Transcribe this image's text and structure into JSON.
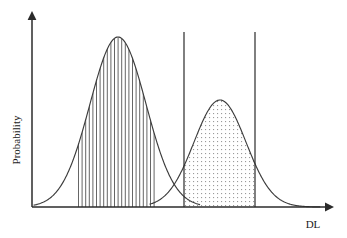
{
  "figure": {
    "width": 347,
    "height": 238,
    "background_color": "#ffffff",
    "line_color": "#3c3c3c",
    "axis_color": "#2b2b2b",
    "hatch_color": "#555555",
    "dot_color": "#8a8a8a"
  },
  "axes": {
    "y_axis_label": "Probability",
    "x_axis_label": "DL",
    "y_axis_label_font_size": 11,
    "x_axis_label_font_size": 11,
    "origin_x": 32,
    "baseline_y": 207,
    "x_axis_end": 330,
    "y_axis_top": 14,
    "has_ticks": false,
    "has_gridlines": false
  },
  "chart_data": {
    "type": "line",
    "title": "",
    "xlabel": "DL",
    "ylabel": "Probability",
    "xlim": [
      0,
      1
    ],
    "ylim": [
      0,
      1
    ],
    "grid": false,
    "legend": "none",
    "annotation": "Two overlapping probability density curves over the DL axis; the left (larger) distribution is filled with vertical hatching, the right (smaller) distribution is filled with a stipple dot pattern and bounded by two vertical threshold lines.",
    "series": [
      {
        "name": "distribution-1",
        "fill_style": "vertical-hatch",
        "peak_x_px": 118,
        "peak_y_px": 37,
        "peak_height_rel": 1.0,
        "sigma_px": 28,
        "fill_left_x_px": 78,
        "fill_right_x_px": 157,
        "curve_start_x_px": 34,
        "curve_end_x_px": 200
      },
      {
        "name": "distribution-2",
        "fill_style": "stipple-dots",
        "peak_x_px": 220,
        "peak_y_px": 100,
        "peak_height_rel": 0.63,
        "sigma_px": 26,
        "fill_left_x_px": 184,
        "fill_right_x_px": 255,
        "curve_start_x_px": 150,
        "curve_end_x_px": 320
      }
    ],
    "threshold_lines": [
      {
        "name": "threshold-left",
        "x_px": 184,
        "top_y_px": 32,
        "bottom_y_px": 207
      },
      {
        "name": "threshold-right",
        "x_px": 255,
        "top_y_px": 32,
        "bottom_y_px": 207
      }
    ]
  }
}
